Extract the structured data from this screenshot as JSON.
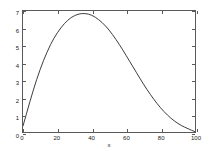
{
  "chart_data": {
    "type": "line",
    "title": "",
    "xlabel": "x",
    "ylabel": "",
    "xlim": [
      0,
      100
    ],
    "ylim": [
      0,
      7
    ],
    "grid": false,
    "legend": null,
    "xticks": [
      0,
      20,
      40,
      60,
      80,
      100
    ],
    "yticks": [
      0,
      1,
      2,
      3,
      4,
      5,
      6,
      7
    ],
    "xtick_labels": [
      "0",
      "20",
      "40",
      "60",
      "80",
      "100"
    ],
    "ytick_labels": [
      "0",
      "1",
      "2",
      "3",
      "4",
      "5",
      "6",
      "7"
    ],
    "line_color": "#3a3a3a",
    "line_width": 1,
    "series": [
      {
        "name": "curve",
        "x": [
          0,
          2,
          4,
          6,
          8,
          10,
          12,
          14,
          16,
          18,
          20,
          22,
          24,
          26,
          28,
          30,
          32,
          34,
          36,
          38,
          40,
          42,
          44,
          46,
          48,
          50,
          52,
          54,
          56,
          58,
          60,
          62,
          64,
          66,
          68,
          70,
          72,
          74,
          76,
          78,
          80,
          82,
          84,
          86,
          88,
          90,
          92,
          94,
          96,
          98,
          100
        ],
        "y": [
          0.35,
          1.05,
          1.75,
          2.42,
          3.05,
          3.62,
          4.15,
          4.62,
          5.05,
          5.42,
          5.74,
          6.02,
          6.26,
          6.46,
          6.62,
          6.73,
          6.81,
          6.85,
          6.85,
          6.82,
          6.75,
          6.64,
          6.5,
          6.33,
          6.13,
          5.9,
          5.64,
          5.36,
          5.06,
          4.75,
          4.42,
          4.09,
          3.76,
          3.43,
          3.1,
          2.78,
          2.47,
          2.18,
          1.9,
          1.64,
          1.4,
          1.18,
          0.98,
          0.8,
          0.64,
          0.5,
          0.38,
          0.28,
          0.19,
          0.1,
          0.02
        ]
      }
    ]
  },
  "axes": {
    "xlabel": "x"
  }
}
